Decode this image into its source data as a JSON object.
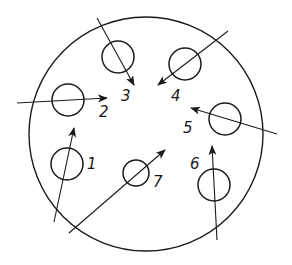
{
  "diagram": {
    "title": "",
    "stroke_color": "#1a1a1a",
    "background": "#ffffff",
    "outer_circle": {
      "cx": 146,
      "cy": 134,
      "r": 117
    },
    "items": [
      {
        "id": "1",
        "label": "1",
        "circle": {
          "cx": 67,
          "cy": 164,
          "r": 16
        },
        "arrow": {
          "x1": 54,
          "y1": 222,
          "x2": 74,
          "y2": 128
        },
        "label_pos": {
          "x": 87,
          "y": 169
        }
      },
      {
        "id": "2",
        "label": "2",
        "circle": {
          "cx": 68,
          "cy": 100,
          "r": 16
        },
        "arrow": {
          "x1": 17,
          "y1": 103,
          "x2": 107,
          "y2": 98
        },
        "label_pos": {
          "x": 99,
          "y": 117
        }
      },
      {
        "id": "3",
        "label": "3",
        "circle": {
          "cx": 118,
          "cy": 57,
          "r": 16
        },
        "arrow": {
          "x1": 97,
          "y1": 18,
          "x2": 134,
          "y2": 85
        },
        "label_pos": {
          "x": 121,
          "y": 101
        }
      },
      {
        "id": "4",
        "label": "4",
        "circle": {
          "cx": 185,
          "cy": 64,
          "r": 16
        },
        "arrow": {
          "x1": 228,
          "y1": 31,
          "x2": 158,
          "y2": 85
        },
        "label_pos": {
          "x": 171,
          "y": 101
        }
      },
      {
        "id": "5",
        "label": "5",
        "circle": {
          "cx": 225,
          "cy": 119,
          "r": 16
        },
        "arrow": {
          "x1": 277,
          "y1": 134,
          "x2": 191,
          "y2": 108
        },
        "label_pos": {
          "x": 183,
          "y": 133
        }
      },
      {
        "id": "6",
        "label": "6",
        "circle": {
          "cx": 214,
          "cy": 185,
          "r": 16
        },
        "arrow": {
          "x1": 217,
          "y1": 240,
          "x2": 212,
          "y2": 146
        },
        "label_pos": {
          "x": 190,
          "y": 169
        }
      },
      {
        "id": "7",
        "label": "7",
        "circle": {
          "cx": 136,
          "cy": 173,
          "r": 13
        },
        "arrow": {
          "x1": 69,
          "y1": 233,
          "x2": 165,
          "y2": 150
        },
        "label_pos": {
          "x": 153,
          "y": 187
        }
      }
    ]
  }
}
